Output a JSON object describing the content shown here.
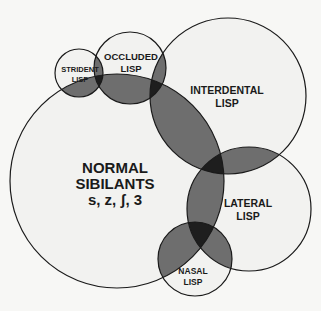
{
  "diagram": {
    "type": "venn",
    "colors": {
      "background": "#f7f7f5",
      "circle_fill": "#f2f2f0",
      "stroke": "#1a1a1a",
      "overlap2": "#6e6e6e",
      "overlap3": "#1e1e1e"
    },
    "circles": [
      {
        "id": "normal",
        "lines": [
          "NORMAL",
          "SIBILANTS",
          "s, z, ʃ, 3"
        ]
      },
      {
        "id": "strident",
        "lines": [
          "STRIDENT",
          "LISP"
        ]
      },
      {
        "id": "occluded",
        "lines": [
          "OCCLUDED",
          "LISP"
        ]
      },
      {
        "id": "interdental",
        "lines": [
          "INTERDENTAL",
          "LISP"
        ]
      },
      {
        "id": "lateral",
        "lines": [
          "LATERAL",
          "LISP"
        ]
      },
      {
        "id": "nasal",
        "lines": [
          "NASAL",
          "LISP"
        ]
      }
    ]
  }
}
